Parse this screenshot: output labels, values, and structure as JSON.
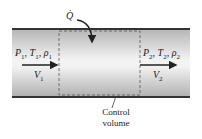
{
  "diagram": {
    "heat_label": "Q̇",
    "inlet": {
      "P": "P",
      "P_sub": "1",
      "T": "T",
      "T_sub": "1",
      "rho": "ρ",
      "rho_sub": "1",
      "V": "V",
      "V_sub": "1"
    },
    "outlet": {
      "P": "P",
      "P_sub": "2",
      "T": "T",
      "T_sub": "2",
      "rho": "ρ",
      "rho_sub": "2",
      "V": "V",
      "V_sub": "2"
    },
    "control_volume_label_line1": "Control",
    "control_volume_label_line2": "volume",
    "colors": {
      "pipe_wall": "#333333",
      "pipe_fill_edge": "#b8b8b8",
      "pipe_fill_center": "#f4f4f4",
      "dashed": "#555555"
    }
  }
}
